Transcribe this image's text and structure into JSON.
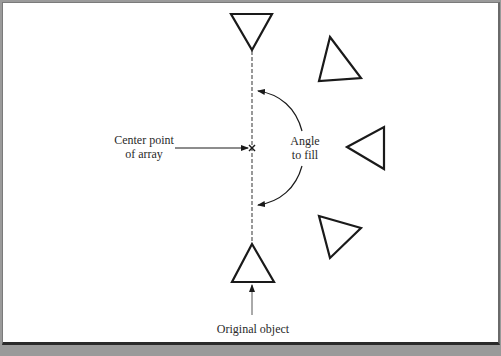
{
  "diagram": {
    "labels": {
      "center_point_line1": "Center point",
      "center_point_line2": "of array",
      "angle_line1": "Angle",
      "angle_line2": "to fill",
      "original_object": "Original object"
    },
    "colors": {
      "stroke": "#1a1a1a",
      "dashed_axis": "#555555",
      "background": "#ffffff",
      "bottom_strip": "#9a9a9a"
    },
    "shapes": {
      "center_marker": "x-mark",
      "triangles": [
        {
          "name": "top-triangle",
          "points": "231,14 272,14 252,50"
        },
        {
          "name": "upper-right-triangle",
          "points": "330,37 361,78 319,81"
        },
        {
          "name": "middle-right-triangle",
          "points": "347,147 384,127 384,169"
        },
        {
          "name": "lower-right-triangle",
          "points": "319,216 361,228 330,258"
        },
        {
          "name": "original-object-triangle",
          "points": "252,244 274,282 232,282"
        }
      ]
    }
  }
}
